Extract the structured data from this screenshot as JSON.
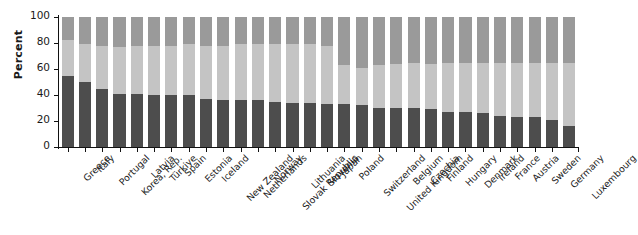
{
  "chart_data": {
    "type": "bar",
    "stacked": true,
    "title": "",
    "subtitle": "",
    "xlabel": "",
    "ylabel": "Percent",
    "ylim": [
      0,
      100
    ],
    "yticks": [
      0,
      20,
      40,
      60,
      80,
      100
    ],
    "ytick_labels": [
      "0",
      "20",
      "40",
      "60",
      "80",
      "100"
    ],
    "grid": false,
    "legend": false,
    "legend_position": "none",
    "categories": [
      "Greece",
      "Italy",
      "Portugal",
      "Korea, Rep.",
      "Latvia",
      "Türkiye",
      "Spain",
      "Estonia",
      "Iceland",
      "New Zealand",
      "Netherlands",
      "Norway",
      "Slovak Republic",
      "Lithuania",
      "Slovenia",
      "Japan",
      "Poland",
      "Switzerland",
      "United Kingdom",
      "Belgium",
      "Czechia",
      "Finland",
      "Hungary",
      "Denmark",
      "Ireland",
      "France",
      "Austria",
      "Sweden",
      "Germany",
      "Luxembourg"
    ],
    "series": [
      {
        "name": "segment-bottom",
        "color": "#4d4d4d",
        "values": [
          55,
          50,
          45,
          41,
          41,
          40,
          40,
          40,
          37,
          36,
          36,
          36,
          35,
          34,
          34,
          33,
          33,
          32,
          30,
          30,
          30,
          29,
          27,
          27,
          26,
          24,
          23,
          23,
          21,
          16
        ]
      },
      {
        "name": "segment-middle",
        "color": "#c4c4c4",
        "values": [
          27,
          29,
          33,
          36,
          37,
          38,
          38,
          39,
          41,
          42,
          43,
          43,
          44,
          45,
          45,
          45,
          30,
          29,
          33,
          34,
          35,
          35,
          38,
          38,
          39,
          41,
          42,
          42,
          44,
          49
        ]
      },
      {
        "name": "segment-top",
        "color": "#9a9a9a",
        "values": [
          18,
          21,
          22,
          23,
          22,
          22,
          22,
          21,
          22,
          22,
          21,
          21,
          21,
          21,
          21,
          22,
          37,
          39,
          37,
          36,
          35,
          36,
          35,
          35,
          35,
          35,
          35,
          35,
          35,
          35
        ]
      }
    ]
  },
  "axis": {
    "y_title": "Percent"
  }
}
